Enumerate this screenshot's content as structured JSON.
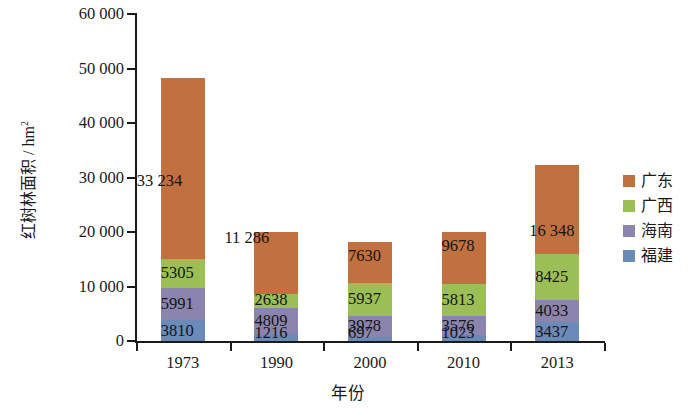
{
  "chart_data": {
    "type": "bar",
    "stacked": true,
    "title": "",
    "xlabel": "年份",
    "ylabel": "红树林面积 / hm²",
    "ylabel_main": "红树林面积 / hm",
    "ylabel_sup": "2",
    "categories": [
      "1973",
      "1990",
      "2000",
      "2010",
      "2013"
    ],
    "ylim": [
      0,
      60000
    ],
    "ytick_values": [
      0,
      10000,
      20000,
      30000,
      40000,
      50000,
      60000
    ],
    "ytick_labels": [
      "0",
      "10 000",
      "20 000",
      "30 000",
      "40 000",
      "50 000",
      "60 000"
    ],
    "grid": false,
    "legend_position": "right",
    "series": [
      {
        "name": "广东",
        "color": "#C1703F",
        "values": [
          33234,
          11286,
          7630,
          9678,
          16348
        ],
        "labels": [
          "33 234",
          "11 286",
          "7630",
          "9678",
          "16 348"
        ]
      },
      {
        "name": "广西",
        "color": "#9CBF55",
        "values": [
          5305,
          2638,
          5937,
          5813,
          8425
        ],
        "labels": [
          "5305",
          "2638",
          "5937",
          "5813",
          "8425"
        ]
      },
      {
        "name": "海南",
        "color": "#8B85AD",
        "values": [
          5991,
          4809,
          3978,
          3576,
          4033
        ],
        "labels": [
          "5991",
          "4809",
          "3978",
          "3576",
          "4033"
        ]
      },
      {
        "name": "福建",
        "color": "#6B8AB8",
        "values": [
          3810,
          1216,
          697,
          1023,
          3437
        ],
        "labels": [
          "3810",
          "1216",
          "697",
          "1023",
          "3437"
        ]
      }
    ],
    "totals": [
      48340,
      19949,
      18242,
      20090,
      32243
    ]
  }
}
